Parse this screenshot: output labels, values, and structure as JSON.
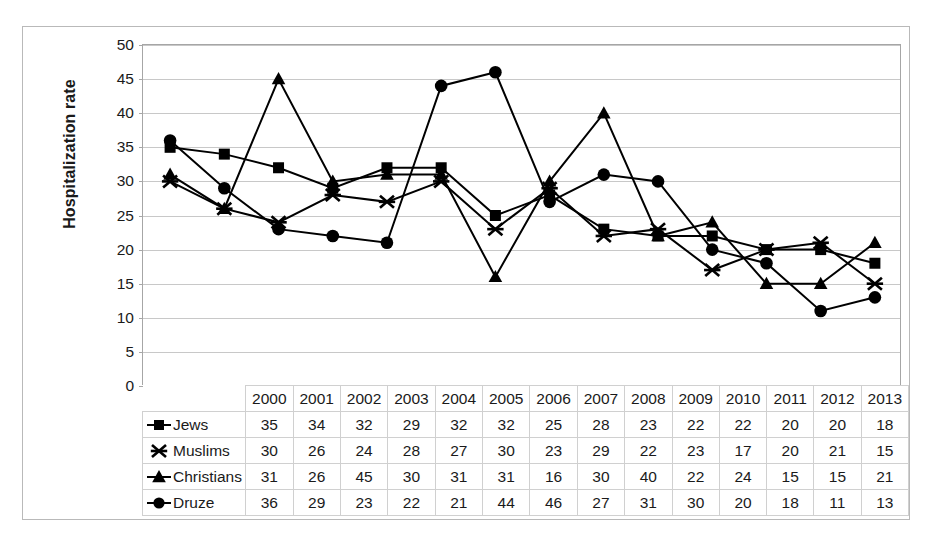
{
  "chart_data": {
    "type": "line",
    "title": "",
    "xlabel": "",
    "ylabel": "Hospitalization rate",
    "ylim": [
      0,
      50
    ],
    "ytick_step": 5,
    "yticks": [
      "50",
      "45",
      "40",
      "35",
      "30",
      "25",
      "20",
      "15",
      "10",
      "5",
      "0"
    ],
    "grid": true,
    "legend_position": "data-table-row-headers",
    "categories": [
      "2000",
      "2001",
      "2002",
      "2003",
      "2004",
      "2005",
      "2006",
      "2007",
      "2008",
      "2009",
      "2010",
      "2011",
      "2012",
      "2013"
    ],
    "series": [
      {
        "name": "Jews",
        "marker": "square",
        "color": "#000000",
        "values": [
          35,
          34,
          32,
          29,
          32,
          32,
          25,
          28,
          23,
          22,
          22,
          20,
          20,
          18
        ]
      },
      {
        "name": "Muslims",
        "marker": "x-star",
        "color": "#000000",
        "values": [
          30,
          26,
          24,
          28,
          27,
          30,
          23,
          29,
          22,
          23,
          17,
          20,
          21,
          15
        ]
      },
      {
        "name": "Christians",
        "marker": "triangle",
        "color": "#000000",
        "values": [
          31,
          26,
          45,
          30,
          31,
          31,
          16,
          30,
          40,
          22,
          24,
          15,
          15,
          21
        ]
      },
      {
        "name": "Druze",
        "marker": "circle",
        "color": "#000000",
        "values": [
          36,
          29,
          23,
          22,
          21,
          44,
          46,
          27,
          31,
          30,
          20,
          18,
          11,
          13
        ]
      }
    ]
  }
}
